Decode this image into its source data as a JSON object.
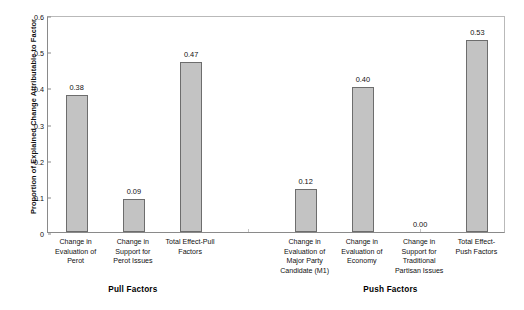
{
  "chart_data": {
    "type": "bar",
    "title": "",
    "subtitle": "",
    "xlabel": "",
    "ylabel": "Proportion of Explained Change Attributable to Factor",
    "ylim": [
      0,
      0.6
    ],
    "ytick_labels": [
      "0.6",
      "0.5",
      "0.4",
      "0.3",
      "0.2",
      "0.1",
      "0"
    ],
    "ytick_values": [
      0.6,
      0.5,
      0.4,
      0.3,
      0.2,
      0.1,
      0
    ],
    "grid": false,
    "legend": false,
    "legend_position": "none",
    "bar_color": "#c3c3c3",
    "bar_border_color": "#6d6d6d",
    "categories": [
      "Change in Evaluation of Perot",
      "Change in Support for Perot Issues",
      "Total Effect-Pull Factors",
      "",
      "Change in Evaluation of Major Party Candidate (M1)",
      "Change in Evaluation of Economy",
      "Change in Support for Traditional Partisan Issues",
      "Total Effect-Push Factors"
    ],
    "values": [
      0.38,
      0.09,
      0.47,
      null,
      0.12,
      0.4,
      0.0,
      0.53
    ],
    "value_labels": [
      "0.38",
      "0.09",
      "0.47",
      "",
      "0.12",
      "0.40",
      "0.00",
      "0.53"
    ],
    "groups": [
      {
        "label": "Pull Factors",
        "category_indices": [
          0,
          1,
          2
        ]
      },
      {
        "label": "Push Factors",
        "category_indices": [
          4,
          5,
          6,
          7
        ]
      }
    ]
  },
  "axis": {
    "y_title": "Proportion of Explained Change Attributable to Factor",
    "ticks": [
      {
        "label": "0.6",
        "value": 0.6
      },
      {
        "label": "0.5",
        "value": 0.5
      },
      {
        "label": "0.4",
        "value": 0.4
      },
      {
        "label": "0.3",
        "value": 0.3
      },
      {
        "label": "0.2",
        "value": 0.2
      },
      {
        "label": "0.1",
        "value": 0.1
      },
      {
        "label": "0",
        "value": 0
      }
    ]
  },
  "bars": [
    {
      "value_label": "0.38",
      "value": 0.38,
      "has_bar": true,
      "cat_lines": [
        "Change in",
        "Evaluation of",
        "Perot"
      ]
    },
    {
      "value_label": "0.09",
      "value": 0.09,
      "has_bar": true,
      "cat_lines": [
        "Change in",
        "Support for",
        "Perot Issues"
      ]
    },
    {
      "value_label": "0.47",
      "value": 0.47,
      "has_bar": true,
      "cat_lines": [
        "Total Effect-Pull",
        "Factors"
      ]
    },
    {
      "value_label": "",
      "value": null,
      "has_bar": false,
      "cat_lines": []
    },
    {
      "value_label": "0.12",
      "value": 0.12,
      "has_bar": true,
      "cat_lines": [
        "Change in",
        "Evaluation of",
        "Major Party",
        "Candidate (M1)"
      ]
    },
    {
      "value_label": "0.40",
      "value": 0.4,
      "has_bar": true,
      "cat_lines": [
        "Change in",
        "Evaluation of",
        "Economy"
      ]
    },
    {
      "value_label": "0.00",
      "value": 0.0,
      "has_bar": false,
      "cat_lines": [
        "Change in",
        "Support for",
        "Traditional",
        "Partisan Issues"
      ]
    },
    {
      "value_label": "0.53",
      "value": 0.53,
      "has_bar": true,
      "cat_lines": [
        "Total Effect-",
        "Push Factors"
      ]
    }
  ],
  "groups": [
    {
      "label": "Pull Factors"
    },
    {
      "label": "Push Factors"
    }
  ]
}
